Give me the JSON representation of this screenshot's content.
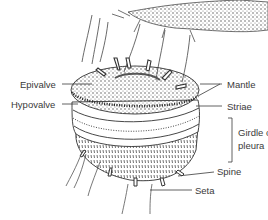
{
  "diagram": {
    "labels": {
      "epivalve": "Epivalve",
      "hypovalve": "Hypovalve",
      "mantle": "Mantle",
      "striae": "Striae",
      "girdle_line1": "Girdle or",
      "girdle_line2": "pleura",
      "spine": "Spine",
      "seta": "Seta"
    },
    "colors": {
      "ink": "#3a3a3a",
      "background": "#ffffff"
    }
  }
}
